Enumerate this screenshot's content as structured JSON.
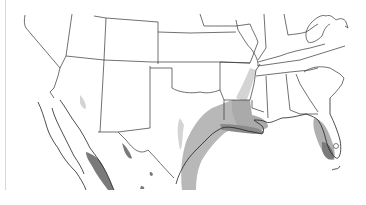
{
  "map": {
    "title": "",
    "region": "Southern United States and Northern Mexico",
    "style": "grayscale thematic choropleth",
    "colors": {
      "background": "#ffffff",
      "boundary": "#333333",
      "light_shade": "#d4d4d4",
      "mid_shade": "#b0b0b0",
      "dark_shade": "#7a7a7a",
      "border_frame": "#d8d8d8"
    },
    "shaded_areas": [
      {
        "name": "Arizona",
        "level": "light"
      },
      {
        "name": "West Texas",
        "level": "light"
      },
      {
        "name": "East Texas / Gulf Coast",
        "level": "mid"
      },
      {
        "name": "Louisiana",
        "level": "mid"
      },
      {
        "name": "Louisiana coast",
        "level": "dark"
      },
      {
        "name": "Mississippi River valley",
        "level": "light"
      },
      {
        "name": "Florida",
        "level": "mid"
      },
      {
        "name": "South Florida",
        "level": "dark"
      },
      {
        "name": "Sinaloa / Pacific coast Mexico",
        "level": "dark"
      },
      {
        "name": "Sierra Madre patches",
        "level": "dark"
      }
    ]
  }
}
